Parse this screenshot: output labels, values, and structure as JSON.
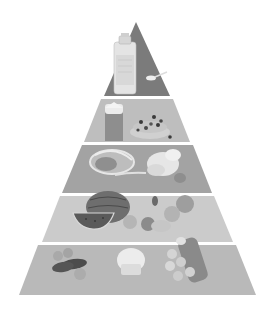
{
  "diagram": {
    "type": "food-pyramid",
    "colors": {
      "background": "#ffffff",
      "separator": "#ffffff"
    },
    "tiers": [
      {
        "level": 1,
        "name": "fats-oils-sugars",
        "color": "#7b7b7b",
        "top": 22,
        "bottom": 96,
        "top_left": 136,
        "top_right": 136,
        "bottom_left": 104,
        "bottom_right": 170,
        "items": [
          "oil-bottle",
          "spoon-of-sugar"
        ]
      },
      {
        "level": 2,
        "name": "dairy",
        "color": "#bebebe",
        "top": 99,
        "bottom": 142,
        "top_left": 101,
        "top_right": 173,
        "bottom_left": 84,
        "bottom_right": 190,
        "items": [
          "milk-carton",
          "cereal-with-berries"
        ]
      },
      {
        "level": 3,
        "name": "protein",
        "color": "#a3a3a3",
        "top": 145,
        "bottom": 193,
        "top_left": 82,
        "top_right": 193,
        "bottom_left": 62,
        "bottom_right": 212,
        "items": [
          "meat-steak",
          "roast-chicken",
          "egg"
        ]
      },
      {
        "level": 4,
        "name": "fruits-vegetables",
        "color": "#cbcbcb",
        "top": 196,
        "bottom": 242,
        "top_left": 60,
        "top_right": 214,
        "bottom_left": 42,
        "bottom_right": 233,
        "items": [
          "watermelon",
          "watermelon-slice",
          "apple",
          "orange",
          "mixed-fruit"
        ]
      },
      {
        "level": 5,
        "name": "grains-starches",
        "color": "#b9b9b9",
        "top": 245,
        "bottom": 295,
        "top_left": 38,
        "top_right": 236,
        "bottom_left": 19,
        "bottom_right": 256,
        "items": [
          "potatoes-sweet-potatoes",
          "bread-muffin",
          "bread-rolls-pasta"
        ]
      }
    ]
  }
}
